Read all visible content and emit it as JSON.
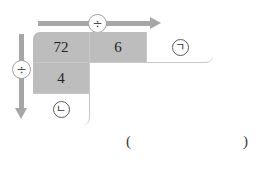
{
  "diagram": {
    "type": "division-table-puzzle",
    "colors": {
      "shaded_cell": "#bdbdbd",
      "blank_cell": "#ffffff",
      "arrow": "#a6a6a6",
      "cell_border": "#c9c9c9",
      "text": "#242424"
    },
    "operators": {
      "row_operator": {
        "symbol": "÷",
        "name": "division-sign",
        "direction": "left-to-right"
      },
      "column_operator": {
        "symbol": "÷",
        "name": "division-sign",
        "direction": "top-to-bottom"
      }
    },
    "top_row": {
      "cells": [
        {
          "value": "72",
          "shaded": true
        },
        {
          "value": "6",
          "shaded": true
        },
        {
          "value": "ㄱ",
          "shaded": false,
          "circled": true,
          "label": "circled-giyeok-blank"
        }
      ]
    },
    "left_column": {
      "cells": [
        {
          "value": "72",
          "shaded": true
        },
        {
          "value": "4",
          "shaded": true
        },
        {
          "value": "ㄴ",
          "shaded": false,
          "circled": true,
          "label": "circled-nieun-blank"
        }
      ]
    },
    "answer": {
      "open_paren": "(",
      "close_paren": ")",
      "value": ""
    }
  }
}
